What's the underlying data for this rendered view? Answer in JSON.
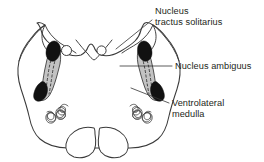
{
  "figure": {
    "background_color": "#ffffff",
    "ink_color": "#333333",
    "nucleus_fill_color": "#111111",
    "band_fill_color": "#c3c3c3"
  },
  "labels": [
    {
      "id": "nucleus-tractus-solitarius",
      "line1": "Nucleus",
      "line2": "tractus solitarius",
      "text_x": 155,
      "text_y": 14,
      "leader": "M152,20 L116,49"
    },
    {
      "id": "nucleus-ambiguus",
      "line1": "Nucleus ambiguus",
      "line2": "",
      "text_x": 175,
      "text_y": 69,
      "leader": "M172,66 L120,66"
    },
    {
      "id": "ventrolateral-medulla",
      "line1": "Ventrolateral",
      "line2": "medulla",
      "text_x": 172,
      "text_y": 106,
      "leader": "M169,103 L131,88"
    }
  ],
  "structures": {
    "outer_contour_name": "medullary-outline",
    "pyramid_left_name": "pyramid-left",
    "pyramid_right_name": "pyramid-right",
    "olive_left_name": "inferior-olive-left",
    "olive_right_name": "inferior-olive-right",
    "nts_left_name": "nts-left",
    "nts_right_name": "nts-right",
    "band_left_name": "ambiguus-band-left",
    "band_right_name": "ambiguus-band-right",
    "vlm_left_name": "ventrolateral-medulla-left",
    "vlm_right_name": "ventrolateral-medulla-right",
    "ventricle_circle_left_name": "central-canal-circle-left",
    "ventricle_circle_right_name": "central-canal-circle-right"
  }
}
